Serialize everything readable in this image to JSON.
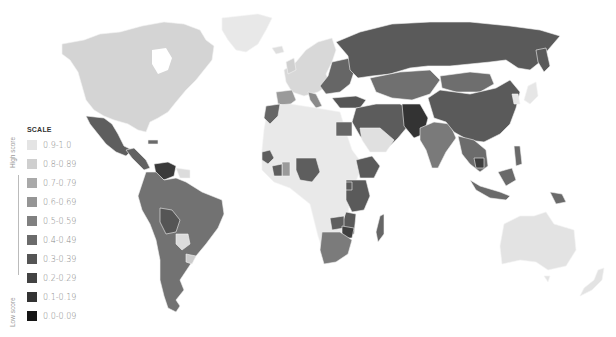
{
  "legend": {
    "title": "SCALE",
    "high_label": "High score",
    "low_label": "Low score",
    "items": [
      {
        "label": "0.9-1.0",
        "color": "#e4e4e4"
      },
      {
        "label": "0.8-0.89",
        "color": "#cfcfcf"
      },
      {
        "label": "0.7-0.79",
        "color": "#a9a9a9"
      },
      {
        "label": "0.6-0.69",
        "color": "#959595"
      },
      {
        "label": "0.5-0.59",
        "color": "#808080"
      },
      {
        "label": "0.4-0.49",
        "color": "#6b6b6b"
      },
      {
        "label": "0.3-0.39",
        "color": "#555555"
      },
      {
        "label": "0.2-0.29",
        "color": "#434343"
      },
      {
        "label": "0.1-0.19",
        "color": "#333333"
      },
      {
        "label": "0.0-0.09",
        "color": "#151515"
      }
    ]
  },
  "map": {
    "regions": [
      {
        "name": "north-america",
        "color": "#d4d4d4"
      },
      {
        "name": "greenland",
        "color": "#e8e8e8"
      },
      {
        "name": "mexico",
        "color": "#5e5e5e"
      },
      {
        "name": "central-america",
        "color": "#626262"
      },
      {
        "name": "venezuela",
        "color": "#3a3a3a"
      },
      {
        "name": "south-america",
        "color": "#727272"
      },
      {
        "name": "bolivia",
        "color": "#555555"
      },
      {
        "name": "paraguay",
        "color": "#dcdcdc"
      },
      {
        "name": "uruguay",
        "color": "#cccccc"
      },
      {
        "name": "western-europe",
        "color": "#d8d8d8"
      },
      {
        "name": "iberia",
        "color": "#9a9a9a"
      },
      {
        "name": "eastern-europe",
        "color": "#666666"
      },
      {
        "name": "russia",
        "color": "#5a5a5a"
      },
      {
        "name": "central-asia",
        "color": "#707070"
      },
      {
        "name": "middle-east",
        "color": "#5c5c5c"
      },
      {
        "name": "afghanistan-pakistan",
        "color": "#333333"
      },
      {
        "name": "india",
        "color": "#7a7a7a"
      },
      {
        "name": "china",
        "color": "#5a5a5a"
      },
      {
        "name": "japan-korea",
        "color": "#e6e6e6"
      },
      {
        "name": "southeast-asia",
        "color": "#6c6c6c"
      },
      {
        "name": "north-africa",
        "color": "#e9e9e9"
      },
      {
        "name": "egypt",
        "color": "#666666"
      },
      {
        "name": "africa-interior",
        "color": "#ececec"
      },
      {
        "name": "west-africa-countries",
        "color": "#5e5e5e"
      },
      {
        "name": "east-africa",
        "color": "#5a5a5a"
      },
      {
        "name": "southern-africa",
        "color": "#7b7b7b"
      },
      {
        "name": "zimbabwe",
        "color": "#3f3f3f"
      },
      {
        "name": "madagascar",
        "color": "#666666"
      },
      {
        "name": "indonesia",
        "color": "#6a6a6a"
      },
      {
        "name": "australia",
        "color": "#e3e3e3"
      },
      {
        "name": "new-zealand",
        "color": "#e3e3e3"
      }
    ]
  }
}
